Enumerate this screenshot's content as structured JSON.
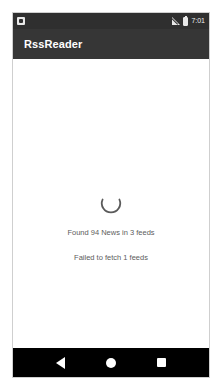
{
  "status_bar": {
    "notification_icon": "notification-square-icon",
    "signal_icon": "signal-no-sim-icon",
    "battery_icon": "battery-icon",
    "time": "7:01"
  },
  "app_bar": {
    "title": "RssReader"
  },
  "content": {
    "spinner": "loading-spinner-arc",
    "lines": [
      {
        "text": "Found 94 News in 3 feeds"
      },
      {
        "text": "Failed to fetch 1 feeds"
      }
    ]
  },
  "nav_bar": {
    "back": "back-triangle-icon",
    "home": "home-circle-icon",
    "recents": "recents-square-icon"
  },
  "colors": {
    "status_bar_bg": "#2f2f2f",
    "app_bar_bg": "#363636",
    "content_bg": "#ffffff",
    "nav_bar_bg": "#000000",
    "spinner": "#5a5a5a",
    "text": "#5d5d5d"
  }
}
